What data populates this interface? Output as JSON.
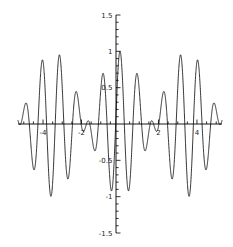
{
  "chart_data": {
    "type": "line",
    "title": "",
    "subtitle": "",
    "xlabel": "",
    "ylabel": "",
    "xlim": [
      -5.3,
      5.3
    ],
    "ylim": [
      -1.5,
      1.5
    ],
    "grid": false,
    "legend": null,
    "axes_style": "centered-cross",
    "line_color": "#000000",
    "line_width": 0.8,
    "x_major_ticks": [
      -4,
      -2,
      2,
      4
    ],
    "x_major_tick_labels": [
      "-4",
      "-2",
      "2",
      "4"
    ],
    "x_minor_tick_step": 0.5,
    "y_major_ticks": [
      -1.5,
      -1,
      -0.5,
      0.5,
      1,
      1.5
    ],
    "y_major_tick_labels": [
      "-1.5",
      "-1",
      "-0.5",
      "0.5",
      "1",
      "1.5"
    ],
    "y_minor_tick_step": 0.1,
    "function": "cos(7x)*cos(0.9x) style beat pattern",
    "series": [
      {
        "name": "beat-waveform",
        "carrier_frequency": 7.0,
        "envelope_frequency": 0.9,
        "amplitude": 1.0,
        "samples": 2400
      }
    ]
  },
  "axis_labels": {
    "y_top": "1.5",
    "y_one": "1",
    "y_half": "0.5",
    "y_neg_half": "-0.5",
    "y_neg_one": "-1",
    "y_bottom": "-1.5",
    "x_neg_four": "-4",
    "x_neg_two": "-2",
    "x_two": "2",
    "x_four": "4"
  }
}
